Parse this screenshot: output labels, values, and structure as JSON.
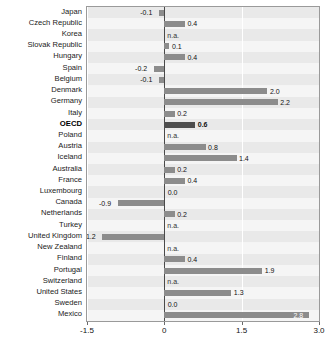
{
  "chart_data": {
    "type": "bar",
    "orientation": "horizontal",
    "title": "",
    "subtitle": "",
    "xlabel": "",
    "ylabel": "",
    "xlim": [
      -1.5,
      3.0
    ],
    "xticks": [
      -1.5,
      0,
      1.5,
      3.0
    ],
    "xtick_labels": [
      "-1.5",
      "0",
      "1.5",
      "3.0"
    ],
    "grid": true,
    "legend": "none",
    "highlight_category": "OECD",
    "na_text": "n.a.",
    "categories": [
      "Japan",
      "Czech Republic",
      "Korea",
      "Slovak Republic",
      "Hungary",
      "Spain",
      "Belgium",
      "Denmark",
      "Germany",
      "Italy",
      "OECD",
      "Poland",
      "Austria",
      "Iceland",
      "Australia",
      "France",
      "Luxembourg",
      "Canada",
      "Netherlands",
      "Turkey",
      "United Kingdom",
      "New Zealand",
      "Finland",
      "Portugal",
      "Switzerland",
      "United States",
      "Sweden",
      "Mexico"
    ],
    "values": [
      -0.1,
      0.4,
      null,
      0.1,
      0.4,
      -0.2,
      -0.1,
      2.0,
      2.2,
      0.2,
      0.6,
      null,
      0.8,
      1.4,
      0.2,
      0.4,
      0.0,
      -0.9,
      0.2,
      null,
      -1.2,
      null,
      0.4,
      1.9,
      null,
      1.3,
      0.0,
      2.8
    ],
    "value_labels": [
      "-0.1",
      "0.4",
      "n.a.",
      "0.1",
      "0.4",
      "-0.2",
      "-0.1",
      "2.0",
      "2.2",
      "0.2",
      "0.6",
      "n.a.",
      "0.8",
      "1.4",
      "0.2",
      "0.4",
      "0.0",
      "-0.9",
      "0.2",
      "n.a.",
      "-1.2",
      "n.a.",
      "0.4",
      "1.9",
      "n.a.",
      "1.3",
      "0.0",
      "2.8"
    ]
  },
  "colors": {
    "bar": "#8c8c8c",
    "bar_highlight": "#4d4d4d",
    "plot_background": "#f4f4f4",
    "band": "#e9e9e9",
    "axis": "#4a4a4a",
    "frame": "#9a9a9a",
    "text": "#111111"
  }
}
